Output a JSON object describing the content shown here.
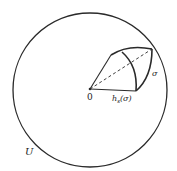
{
  "diagram": {
    "labels": {
      "origin": "0",
      "region": "U",
      "map": "h",
      "map_subscript": "s",
      "map_arg": "(σ)",
      "simplex": "σ"
    },
    "colors": {
      "stroke": "#2a2a2a",
      "background": "#ffffff"
    },
    "geometry": {
      "circle_center": [
        90,
        90
      ],
      "circle_radius": 77,
      "origin_point": [
        90,
        89
      ],
      "sector_top_vertex": [
        111,
        55
      ],
      "sector_tip": [
        152,
        49
      ],
      "sector_bottom_vertex": [
        136,
        91
      ]
    }
  }
}
